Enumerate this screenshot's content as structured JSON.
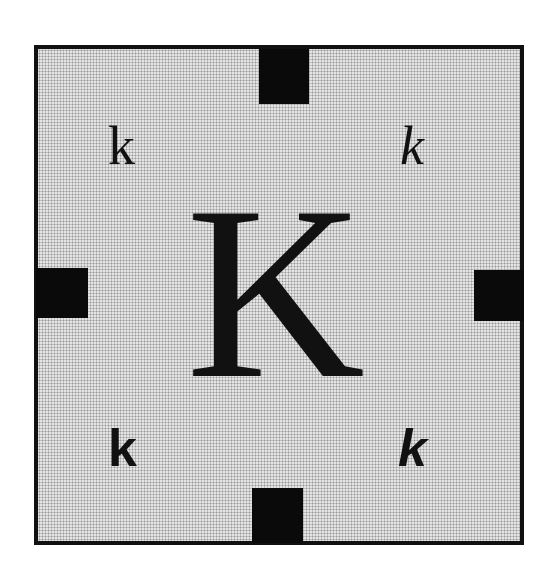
{
  "figure": {
    "frame": {
      "border_color": "#111111",
      "fill_pattern": "stipple-dots",
      "fill_color": "#e4e4e4"
    },
    "center_letter": {
      "text": "K",
      "style": "serif-regular-uppercase"
    },
    "corner_letters": {
      "top_left": {
        "text": "k",
        "style": "serif-regular"
      },
      "top_right": {
        "text": "k",
        "style": "serif-italic"
      },
      "bottom_left": {
        "text": "k",
        "style": "sans-bold"
      },
      "bottom_right": {
        "text": "k",
        "style": "sans-bold-italic"
      }
    },
    "edge_tabs": {
      "color": "#0a0a0a",
      "positions": [
        "top",
        "right",
        "bottom",
        "left"
      ]
    }
  }
}
